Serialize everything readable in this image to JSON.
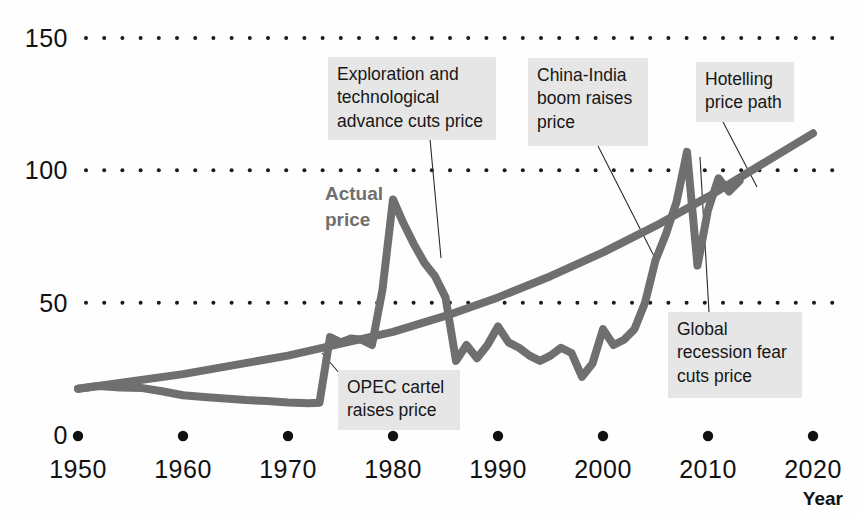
{
  "chart_data": {
    "type": "line",
    "title": "",
    "xlabel": "Year",
    "ylabel": "",
    "xlim": [
      1950,
      2020
    ],
    "ylim": [
      0,
      150
    ],
    "grid": true,
    "legend_position": "inline-annotation",
    "y_ticks": [
      "150",
      "100",
      "50",
      "0"
    ],
    "y_tick_values": [
      150,
      100,
      50,
      0
    ],
    "x_ticks": [
      "1950",
      "1960",
      "1970",
      "1980",
      "1990",
      "2000",
      "2010",
      "2020"
    ],
    "x_tick_values": [
      1950,
      1960,
      1970,
      1980,
      1990,
      2000,
      2010,
      2020
    ],
    "series": [
      {
        "name": "Actual price",
        "color": "#6f6f6f",
        "points": [
          [
            1950,
            17.5
          ],
          [
            1952,
            18.5
          ],
          [
            1954,
            18.0
          ],
          [
            1956,
            17.8
          ],
          [
            1958,
            16.5
          ],
          [
            1960,
            15.0
          ],
          [
            1962,
            14.4
          ],
          [
            1964,
            13.8
          ],
          [
            1966,
            13.2
          ],
          [
            1968,
            12.8
          ],
          [
            1970,
            12.3
          ],
          [
            1972,
            12.0
          ],
          [
            1973,
            12.2
          ],
          [
            1974,
            37.0
          ],
          [
            1975,
            35.0
          ],
          [
            1976,
            36.5
          ],
          [
            1977,
            36.0
          ],
          [
            1978,
            34.0
          ],
          [
            1979,
            55.0
          ],
          [
            1980,
            89.0
          ],
          [
            1981,
            80.0
          ],
          [
            1982,
            72.0
          ],
          [
            1983,
            65.0
          ],
          [
            1984,
            60.0
          ],
          [
            1985,
            52.0
          ],
          [
            1986,
            28.0
          ],
          [
            1987,
            34.0
          ],
          [
            1988,
            29.0
          ],
          [
            1989,
            34.0
          ],
          [
            1990,
            41.0
          ],
          [
            1991,
            35.0
          ],
          [
            1992,
            33.0
          ],
          [
            1993,
            30.0
          ],
          [
            1994,
            28.0
          ],
          [
            1995,
            30.0
          ],
          [
            1996,
            33.0
          ],
          [
            1997,
            31.0
          ],
          [
            1998,
            22.0
          ],
          [
            1999,
            27.0
          ],
          [
            2000,
            40.0
          ],
          [
            2001,
            34.0
          ],
          [
            2002,
            36.0
          ],
          [
            2003,
            40.0
          ],
          [
            2004,
            50.0
          ],
          [
            2005,
            66.0
          ],
          [
            2006,
            76.0
          ],
          [
            2007,
            88.0
          ],
          [
            2008,
            107.0
          ],
          [
            2009,
            64.0
          ],
          [
            2010,
            85.0
          ],
          [
            2011,
            97.0
          ],
          [
            2012,
            92.0
          ],
          [
            2013,
            96.0
          ]
        ]
      },
      {
        "name": "Hotelling price path",
        "color": "#6f6f6f",
        "points": [
          [
            1950,
            17.5
          ],
          [
            1960,
            23.0
          ],
          [
            1970,
            30.0
          ],
          [
            1980,
            39.0
          ],
          [
            1985,
            45.0
          ],
          [
            1990,
            52.0
          ],
          [
            1995,
            60.0
          ],
          [
            2000,
            69.0
          ],
          [
            2005,
            79.0
          ],
          [
            2010,
            90.0
          ],
          [
            2015,
            102.0
          ],
          [
            2020,
            114.0
          ]
        ]
      }
    ],
    "annotations": [
      {
        "id": "opec",
        "text": "OPEC cartel\nraises price",
        "box": {
          "x": 338,
          "y": 370,
          "w": 122,
          "h": 54
        },
        "leader": {
          "x1": 340,
          "y1": 374,
          "x2": 322,
          "y2": 353
        }
      },
      {
        "id": "exploration",
        "text": "Exploration and\ntechnological\nadvance cuts price",
        "box": {
          "x": 328,
          "y": 57,
          "w": 168,
          "h": 82
        },
        "leader": {
          "x1": 430,
          "y1": 139,
          "x2": 441,
          "y2": 258
        }
      },
      {
        "id": "china-india",
        "text": "China-India\nboom raises\nprice",
        "box": {
          "x": 528,
          "y": 58,
          "w": 120,
          "h": 88
        },
        "leader": {
          "x1": 598,
          "y1": 146,
          "x2": 657,
          "y2": 262
        }
      },
      {
        "id": "hotelling",
        "text": "Hotelling\nprice path",
        "box": {
          "x": 696,
          "y": 62,
          "w": 98,
          "h": 58
        },
        "leader": {
          "x1": 722,
          "y1": 120,
          "x2": 757,
          "y2": 187
        }
      },
      {
        "id": "recession",
        "text": "Global\nrecession fear\ncuts price",
        "box": {
          "x": 668,
          "y": 312,
          "w": 134,
          "h": 86
        },
        "leader": {
          "x1": 709,
          "y1": 312,
          "x2": 700,
          "y2": 157
        }
      }
    ],
    "series_label": {
      "text": "Actual\nprice",
      "x": 325,
      "y": 200
    }
  },
  "axes": {
    "x_axis_title": "Year"
  }
}
